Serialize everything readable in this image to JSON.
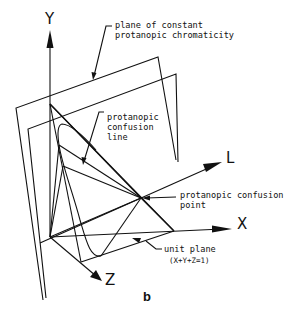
{
  "figure": {
    "panel_label": "b",
    "axes": {
      "y": "Y",
      "x": "X",
      "z": "Z",
      "l": "L"
    },
    "annotations": {
      "plane": [
        "plane of constant",
        "protanopic chromaticity"
      ],
      "confusion_line": [
        "protanopic",
        "confusion",
        "line"
      ],
      "confusion_point": [
        "protanopic confusion",
        "point"
      ],
      "unit_plane": [
        "unit plane",
        "(X+Y+Z=1)"
      ]
    },
    "colors": {
      "ink": "#111111",
      "background": "#ffffff"
    }
  }
}
